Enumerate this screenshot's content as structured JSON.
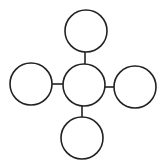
{
  "diagram": {
    "type": "hub-and-spoke",
    "width": 164,
    "height": 167,
    "stroke_color": "#222222",
    "fill_color": "#ffffff",
    "nodes": [
      {
        "id": "center",
        "role": "hub",
        "cx": 84,
        "cy": 85,
        "r": 21,
        "label": ""
      },
      {
        "id": "top",
        "role": "spoke-top",
        "cx": 86,
        "cy": 31,
        "r": 21,
        "label": ""
      },
      {
        "id": "left",
        "role": "spoke-left",
        "cx": 31,
        "cy": 84,
        "r": 21,
        "label": ""
      },
      {
        "id": "right",
        "role": "spoke-right",
        "cx": 135,
        "cy": 87,
        "r": 21,
        "label": ""
      },
      {
        "id": "bottom",
        "role": "spoke-bottom",
        "cx": 82,
        "cy": 138,
        "r": 21,
        "label": ""
      }
    ],
    "edges": [
      {
        "from": "center",
        "to": "top",
        "x1": 85,
        "y1": 64,
        "x2": 85,
        "y2": 52
      },
      {
        "from": "center",
        "to": "left",
        "x1": 63,
        "y1": 84,
        "x2": 52,
        "y2": 84
      },
      {
        "from": "center",
        "to": "right",
        "x1": 105,
        "y1": 87,
        "x2": 114,
        "y2": 87
      },
      {
        "from": "center",
        "to": "bottom",
        "x1": 82,
        "y1": 106,
        "x2": 82,
        "y2": 117
      }
    ]
  }
}
